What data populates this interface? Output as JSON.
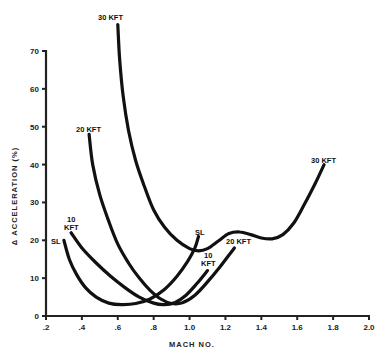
{
  "chart_data": {
    "type": "line",
    "title": "",
    "xlabel": "MACH NO.",
    "ylabel": "Δ ACCELERATION (%)",
    "xlim": [
      0.2,
      2.0
    ],
    "ylim": [
      0,
      70
    ],
    "grid": false,
    "legend": "inline labels at curve ends",
    "x_ticks": [
      ".2",
      ".4",
      ".6",
      ".8",
      "1.0",
      "1.2",
      "1.4",
      "1.6",
      "1.8",
      "2.0"
    ],
    "x_tick_values": [
      0.2,
      0.4,
      0.6,
      0.8,
      1.0,
      1.2,
      1.4,
      1.6,
      1.8,
      2.0
    ],
    "y_ticks": [
      "0",
      "10",
      "20",
      "30",
      "40",
      "50",
      "60",
      "70"
    ],
    "y_tick_values": [
      0,
      10,
      20,
      30,
      40,
      50,
      60,
      70
    ],
    "series": [
      {
        "name": "SL",
        "label": "SL",
        "label_pos": [
          0.22,
          19.5
        ],
        "x": [
          0.3,
          0.33,
          0.37,
          0.42,
          0.48,
          0.55,
          0.62,
          0.7,
          0.78,
          0.86,
          0.93,
          0.99,
          1.03,
          1.05
        ],
        "y": [
          20,
          15,
          11,
          7.5,
          5,
          3.4,
          3.0,
          3.3,
          4.5,
          7,
          10.5,
          14.5,
          18,
          21
        ]
      },
      {
        "name": "10 KFT",
        "label": "10\nKFT",
        "label_pos": [
          0.33,
          24
        ],
        "x": [
          0.34,
          0.4,
          0.48,
          0.56,
          0.64,
          0.72,
          0.8,
          0.86,
          0.92,
          0.98,
          1.04,
          1.1
        ],
        "y": [
          22,
          18,
          14,
          10.5,
          7.5,
          5,
          3.4,
          3.0,
          3.6,
          5.5,
          8.5,
          12
        ]
      },
      {
        "name": "20 KFT",
        "label": "20 KFT",
        "label_pos": [
          0.37,
          49.5
        ],
        "x": [
          0.44,
          0.46,
          0.5,
          0.55,
          0.6,
          0.66,
          0.72,
          0.78,
          0.84,
          0.9,
          0.96,
          1.03,
          1.1,
          1.17,
          1.25
        ],
        "y": [
          48,
          40,
          32,
          25,
          19,
          14,
          10,
          6.8,
          4.5,
          3.3,
          3.5,
          5.5,
          9,
          13,
          18
        ]
      },
      {
        "name": "30 KFT",
        "label": "30 KFT",
        "label_pos": [
          0.53,
          78.5
        ],
        "label2": "30 KFT",
        "label2_pos": [
          1.7,
          42
        ],
        "x": [
          0.6,
          0.61,
          0.63,
          0.66,
          0.7,
          0.75,
          0.8,
          0.86,
          0.93,
          1.0,
          1.05,
          1.1,
          1.16,
          1.22,
          1.28,
          1.34,
          1.4,
          1.46,
          1.52,
          1.58,
          1.64,
          1.7,
          1.75
        ],
        "y": [
          77,
          68,
          58,
          49,
          41,
          34,
          28,
          23.5,
          20,
          17.8,
          17.2,
          17.8,
          19.8,
          21.8,
          22.2,
          21.5,
          20.6,
          20.4,
          21.5,
          24.5,
          29.5,
          35,
          40
        ]
      }
    ]
  },
  "labels": {
    "xlabel": "MACH NO.",
    "ylabel": "Δ ACCELERATION (%)",
    "curve_sl": "SL",
    "curve_10kft_line1": "10",
    "curve_10kft_line2": "KFT",
    "curve_20kft": "20 KFT",
    "curve_30kft_top": "30 KFT",
    "curve_30kft_right": "30 KFT",
    "inline_sl": "SL",
    "inline_10_line1": "10",
    "inline_10_line2": "KFT",
    "inline_20kft": "20 KFT"
  }
}
